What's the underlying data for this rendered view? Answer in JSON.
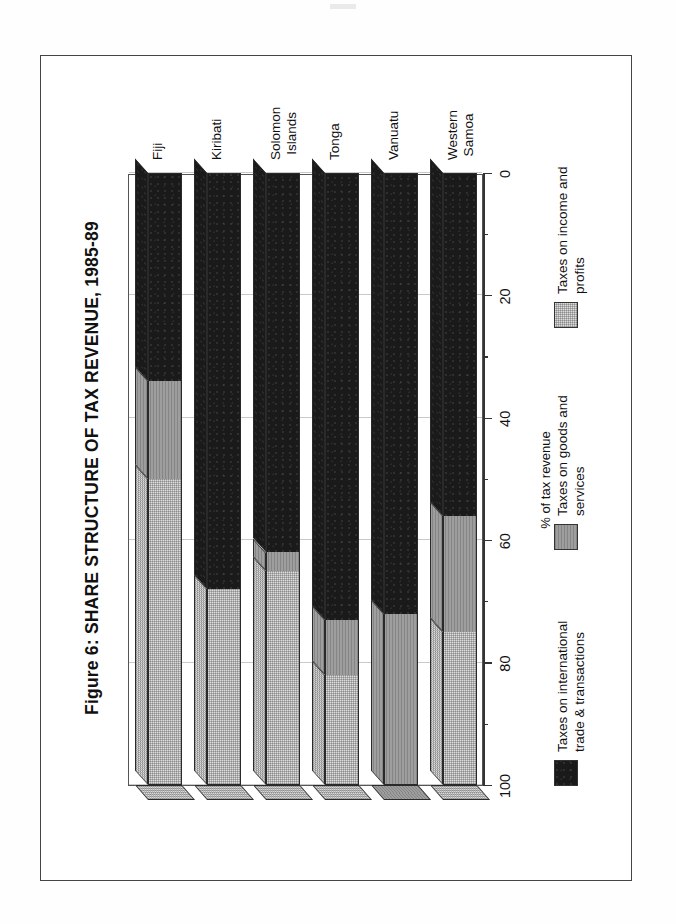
{
  "figure": {
    "title": "Figure 6: SHARE STRUCTURE OF TAX REVENUE, 1985-89"
  },
  "chart_data": {
    "type": "bar",
    "orientation": "vertical-stacked-100-rotated",
    "title": "Figure 6: SHARE STRUCTURE OF TAX REVENUE, 1985-89",
    "xlabel": "",
    "ylabel": "% of tax revenue",
    "ylim": [
      0,
      100
    ],
    "yticks": [
      0,
      20,
      40,
      60,
      80,
      100
    ],
    "ytick_labels": [
      "0",
      "20",
      "40",
      "60",
      "80",
      "100"
    ],
    "grid": true,
    "legend_position": "bottom",
    "categories": [
      "Fiji",
      "Kiribati",
      "Solomon\nIslands",
      "Tonga",
      "Vanuatu",
      "Western\nSamoa"
    ],
    "series": [
      {
        "name": "Taxes on international trade & transactions",
        "color": "#1a1a1a",
        "values": [
          34,
          68,
          62,
          73,
          72,
          56
        ]
      },
      {
        "name": "Taxes on goods and services",
        "color": "#9e9e9e",
        "values": [
          16,
          0,
          3,
          9,
          28,
          19
        ]
      },
      {
        "name": "Taxes on income and profits",
        "color": "#dcdcdc",
        "values": [
          50,
          32,
          35,
          18,
          0,
          25
        ]
      }
    ]
  },
  "axis": {
    "ticks": [
      {
        "label": "100",
        "value": 100
      },
      {
        "label": "80",
        "value": 80
      },
      {
        "label": "60",
        "value": 60
      },
      {
        "label": "40",
        "value": 40
      },
      {
        "label": "20",
        "value": 20
      },
      {
        "label": "0",
        "value": 0
      }
    ],
    "title": "% of tax revenue"
  },
  "categories": [
    {
      "label": "Fiji"
    },
    {
      "label": "Kiribati"
    },
    {
      "label": "Solomon\nIslands"
    },
    {
      "label": "Tonga"
    },
    {
      "label": "Vanuatu"
    },
    {
      "label": "Western\nSamoa"
    }
  ],
  "legend": [
    {
      "label": "Taxes on international\ntrade & transactions",
      "color": "#1a1a1a",
      "fill": "fill-black"
    },
    {
      "label": "Taxes on goods and\nservices",
      "color": "#9e9e9e",
      "fill": "fill-mid"
    },
    {
      "label": "Taxes on income and\nprofits",
      "color": "#dcdcdc",
      "fill": "fill-light"
    }
  ]
}
